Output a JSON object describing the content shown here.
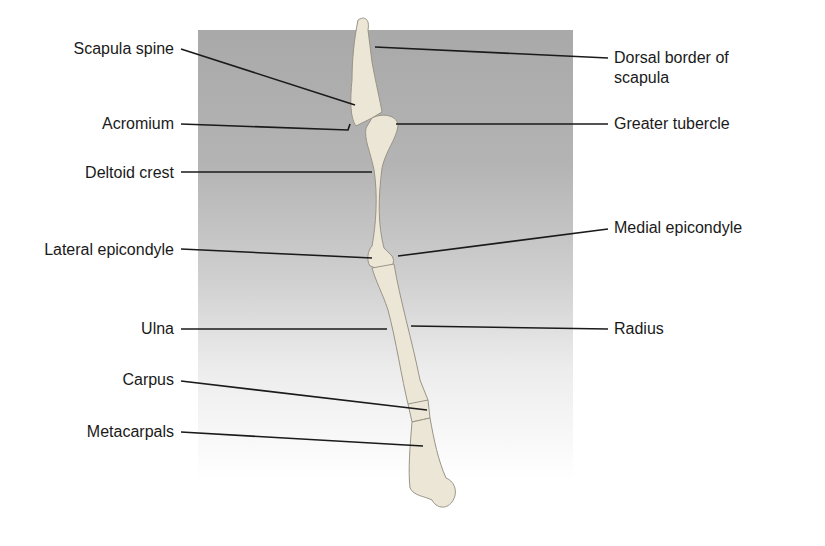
{
  "figure": {
    "background_panel": {
      "top_color": "#a9a9a9",
      "bottom_color": "#ffffff"
    },
    "line_color": "#1a1a1a"
  },
  "labels_left": [
    {
      "id": "scapula-spine",
      "text": "Scapula spine"
    },
    {
      "id": "acromium",
      "text": "Acromium"
    },
    {
      "id": "deltoid-crest",
      "text": "Deltoid crest"
    },
    {
      "id": "lateral-epicondyle",
      "text": "Lateral epicondyle"
    },
    {
      "id": "ulna",
      "text": "Ulna"
    },
    {
      "id": "carpus",
      "text": "Carpus"
    },
    {
      "id": "metacarpals",
      "text": "Metacarpals"
    }
  ],
  "labels_right": [
    {
      "id": "dorsal-border",
      "text": "Dorsal border of scapula"
    },
    {
      "id": "greater-tubercle",
      "text": "Greater tubercle"
    },
    {
      "id": "medial-epicondyle",
      "text": "Medial epicondyle"
    },
    {
      "id": "radius",
      "text": "Radius"
    }
  ]
}
